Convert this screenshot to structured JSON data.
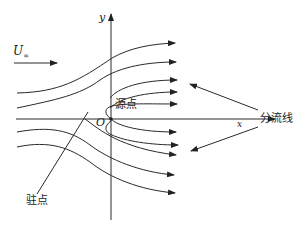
{
  "diagram": {
    "title": "",
    "axes": {
      "x_label": "x",
      "y_label": "y",
      "origin_label": "O"
    },
    "freestream": {
      "symbol": "U",
      "subscript": "∞"
    },
    "labels": {
      "source_point": "源点",
      "stagnation_point": "驻点",
      "dividing_streamline": "分流线"
    },
    "colors": {
      "stroke": "#2a2a2a",
      "background": "#ffffff"
    },
    "streamlines_upper_count": 5,
    "streamlines_lower_count": 5
  }
}
